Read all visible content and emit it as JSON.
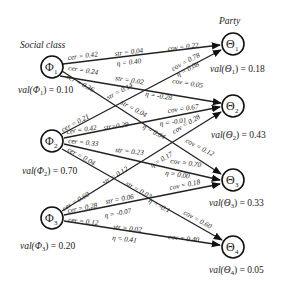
{
  "diagram": {
    "titles": {
      "left": "Social class",
      "right": "Party"
    },
    "left_nodes": [
      {
        "id": "Phi1",
        "symbol": "Φ",
        "sub": "1",
        "x": 52,
        "y": 67,
        "val_label": "val(Φ",
        "val_sub": "1",
        "val_rest": ") = 0.10",
        "value": 0.1
      },
      {
        "id": "Phi2",
        "symbol": "Φ",
        "sub": "2",
        "x": 52,
        "y": 141,
        "val_label": "val(Φ",
        "val_sub": "2",
        "val_rest": ") = 0.70",
        "value": 0.7
      },
      {
        "id": "Phi3",
        "symbol": "Φ",
        "sub": "3",
        "x": 52,
        "y": 218,
        "val_label": "val(Φ",
        "val_sub": "3",
        "val_rest": ") = 0.20",
        "value": 0.2
      }
    ],
    "right_nodes": [
      {
        "id": "Theta1",
        "symbol": "Θ",
        "sub": "1",
        "x": 233,
        "y": 44,
        "val_label": "val(Θ",
        "val_sub": "1",
        "val_rest": ") = 0.18",
        "value": 0.18
      },
      {
        "id": "Theta2",
        "symbol": "Θ",
        "sub": "2",
        "x": 233,
        "y": 106,
        "val_label": "val(Θ",
        "val_sub": "2",
        "val_rest": ") = 0.43",
        "value": 0.43
      },
      {
        "id": "Theta3",
        "symbol": "Θ",
        "sub": "3",
        "x": 233,
        "y": 180,
        "val_label": "val(Θ",
        "val_sub": "3",
        "val_rest": ") = 0.33",
        "value": 0.33
      },
      {
        "id": "Theta4",
        "symbol": "Θ",
        "sub": "4",
        "x": 233,
        "y": 245,
        "val_label": "val(Θ",
        "val_sub": "4",
        "val_rest": ") = 0.05",
        "value": 0.05
      }
    ],
    "edges": [
      {
        "from": "Phi1",
        "to": "Theta1",
        "cer": "cer = 0.42",
        "str": "str = 0.04",
        "eta": "η = 0.40",
        "cov": "cov = 0.22"
      },
      {
        "from": "Phi1",
        "to": "Theta3",
        "cer": "cer = 0.24",
        "str": "str = 0.02",
        "eta": "η = -0.28",
        "cov": "cov = 0.05"
      },
      {
        "from": "Phi1",
        "to": "Theta2",
        "cer": "cer = 0.36",
        "str": "str = 0.14",
        "eta": "η = 0.08",
        "cov": "cov = 0.78"
      },
      {
        "from": "Phi2",
        "to": "Theta1",
        "cer": "cer = 0.21",
        "str": "str = 0.04",
        "eta": "η = 0.04",
        "cov": "cov = 0.12"
      },
      {
        "from": "Phi2",
        "to": "Theta2",
        "cer": "cer = 0.42",
        "str": "str=0.29",
        "eta": "η = -0.01",
        "cov": "cov = 0.67"
      },
      {
        "from": "Phi2",
        "to": "Theta3",
        "cer": "cer = 0.33",
        "str": "str = 0.23",
        "eta": "η = 0.00",
        "cov": "cov = 0.70"
      },
      {
        "from": "Phi2",
        "to": "Theta4",
        "cer": "cer = 0.04",
        "str": "str = 0.03",
        "eta": "η = -0.1",
        "cov": "cov = 0.60"
      },
      {
        "from": "Phi3",
        "to": "Theta2",
        "cer": "cer = 0.60",
        "str": "str = 0.12",
        "eta": "η = 0.17",
        "cov": "cov = 0.28"
      },
      {
        "from": "Phi3",
        "to": "Theta3",
        "cer": "cer = 0.28",
        "str": "str = 0.06",
        "eta": "η = -0.07",
        "cov": "cov = 0.18"
      },
      {
        "from": "Phi3",
        "to": "Theta4",
        "cer": "cer = 0.12",
        "str": "str = 0.02",
        "eta": "η = 0.41",
        "cov": "cov = 0.40"
      }
    ]
  }
}
